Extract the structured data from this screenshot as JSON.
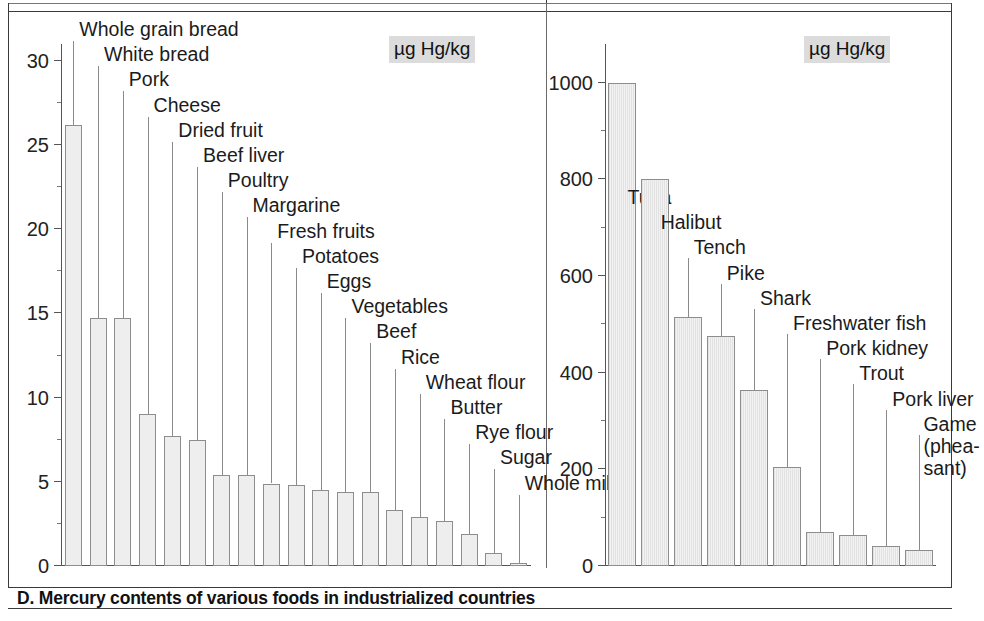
{
  "caption": "D. Mercury contents of various foods in industrialized countries",
  "units": {
    "left": "µg Hg/kg",
    "right": "µg Hg/kg"
  },
  "chart_data": [
    {
      "type": "bar",
      "title": "",
      "xlabel": "",
      "ylabel": "µg Hg/kg",
      "ylim": [
        0,
        31
      ],
      "yticks": [
        0,
        5,
        10,
        15,
        20,
        25,
        30
      ],
      "ytick_labels": [
        "0",
        "5",
        "10",
        "15",
        "20",
        "25",
        "30"
      ],
      "minor_tick_step": 2.5,
      "grid": false,
      "legend": "none",
      "categories": [
        "Whole grain bread",
        "White bread",
        "Pork",
        "Cheese",
        "Dried fruit",
        "Beef liver",
        "Poultry",
        "Margarine",
        "Fresh fruits",
        "Potatoes",
        "Eggs",
        "Vegetables",
        "Beef",
        "Rice",
        "Wheat flour",
        "Butter",
        "Rye flour",
        "Sugar",
        "Whole milk"
      ],
      "values": [
        26.2,
        14.7,
        14.7,
        9.0,
        7.7,
        7.5,
        5.4,
        5.4,
        4.9,
        4.8,
        4.5,
        4.4,
        4.4,
        3.3,
        2.9,
        2.7,
        1.9,
        0.8,
        0.2
      ]
    },
    {
      "type": "bar",
      "title": "",
      "xlabel": "",
      "ylabel": "µg Hg/kg",
      "ylim": [
        0,
        1080
      ],
      "yticks": [
        0,
        200,
        400,
        600,
        800,
        1000
      ],
      "ytick_labels": [
        "0",
        "200",
        "400",
        "600",
        "800",
        "1000"
      ],
      "minor_tick_step": 100,
      "grid": false,
      "legend": "none",
      "categories": [
        "Tuna",
        "Halibut",
        "Tench",
        "Pike",
        "Shark",
        "Freshwater fish",
        "Pork kidney",
        "Trout",
        "Pork liver",
        "Game (pheasant)"
      ],
      "category_display": [
        "Tuna",
        "Halibut",
        "Tench",
        "Pike",
        "Shark",
        "Freshwater fish",
        "Pork kidney",
        "Trout",
        "Pork liver",
        "Game\n(phea-\nsant)"
      ],
      "values": [
        1000,
        800,
        515,
        475,
        365,
        205,
        70,
        65,
        42,
        33
      ]
    }
  ]
}
